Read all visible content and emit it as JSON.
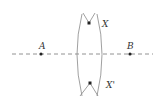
{
  "diagram": {
    "points": [
      {
        "id": "A",
        "label": "A",
        "x": 41,
        "y": 54
      },
      {
        "id": "B",
        "label": "B",
        "x": 130,
        "y": 54
      },
      {
        "id": "X",
        "label": "X",
        "x": 89,
        "y": 23
      },
      {
        "id": "X2",
        "label": "X'",
        "x": 90,
        "y": 83
      }
    ],
    "line": {
      "style": "dashed",
      "from": [
        12,
        54
      ],
      "to": [
        153,
        54
      ]
    },
    "arcs": "two intersecting arcs centered at A and B",
    "colors": {
      "line": "#777777",
      "point": "#222222",
      "label": "#333333"
    }
  }
}
